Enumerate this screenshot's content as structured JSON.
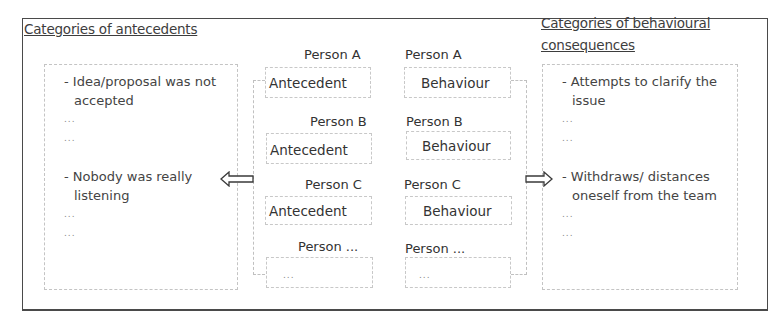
{
  "diagram": {
    "left_panel": {
      "title": "Categories of antecedents",
      "items": [
        {
          "type": "text",
          "text": "- Idea/proposal was not accepted"
        },
        {
          "type": "dots",
          "text": "..."
        },
        {
          "type": "dots",
          "text": "..."
        },
        {
          "type": "spacer",
          "text": ""
        },
        {
          "type": "text",
          "text": "- Nobody was really listening"
        },
        {
          "type": "dots",
          "text": "..."
        },
        {
          "type": "dots",
          "text": "..."
        }
      ]
    },
    "right_panel": {
      "title_line1": "Categories of behavioural",
      "title_line2": "consequences",
      "items": [
        {
          "type": "text",
          "text": "- Attempts to clarify the issue"
        },
        {
          "type": "dots",
          "text": "..."
        },
        {
          "type": "dots",
          "text": "..."
        },
        {
          "type": "spacer",
          "text": ""
        },
        {
          "type": "text",
          "text": "- Withdraws/ distances oneself from the team"
        },
        {
          "type": "dots",
          "text": "..."
        },
        {
          "type": "dots",
          "text": "..."
        }
      ]
    },
    "rows": [
      {
        "person_antecedent": "Person A",
        "antecedent": "Antecedent",
        "person_behaviour": "Person A",
        "behaviour": "Behaviour"
      },
      {
        "person_antecedent": "Person B",
        "antecedent": "Antecedent",
        "person_behaviour": "Person B",
        "behaviour": "Behaviour"
      },
      {
        "person_antecedent": "Person C",
        "antecedent": "Antecedent",
        "person_behaviour": "Person C",
        "behaviour": "Behaviour"
      },
      {
        "person_antecedent": "Person ...",
        "antecedent": "...",
        "person_behaviour": "Person ...",
        "behaviour": "..."
      }
    ],
    "arrows": {
      "left": "arrow-left-outline",
      "right": "arrow-right-outline"
    },
    "colors": {
      "frame": "#4a4a4a",
      "dashed_border": "#c4c4c4",
      "text": "#3a3a3a"
    }
  }
}
